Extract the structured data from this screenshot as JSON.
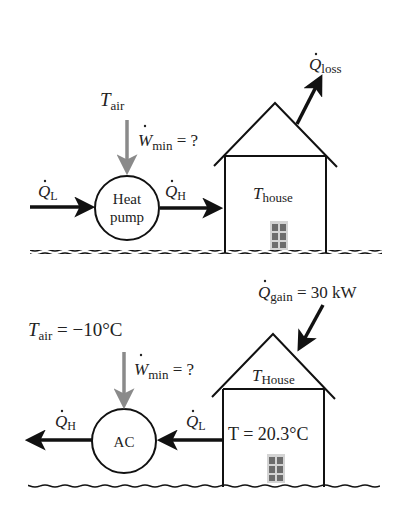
{
  "colors": {
    "line": "#111111",
    "work_arrow": "#8a8a8a",
    "text": "#222222",
    "door": "#777777"
  },
  "top_diagram": {
    "device_label_line1": "Heat",
    "device_label_line2": "pump",
    "t_air": {
      "main": "T",
      "sub": "air"
    },
    "w_min": {
      "main": "W",
      "sub": "min",
      "suffix": " = ?"
    },
    "q_l": {
      "main": "Q",
      "sub": "L"
    },
    "q_h": {
      "main": "Q",
      "sub": "H"
    },
    "q_loss": {
      "main": "Q",
      "sub": "loss"
    },
    "t_house": {
      "main": "T",
      "sub": "house"
    }
  },
  "bottom_diagram": {
    "device_label": "AC",
    "t_air": {
      "main": "T",
      "sub": "air",
      "suffix": " = −10°C"
    },
    "w_min": {
      "main": "W",
      "sub": "min",
      "suffix": " = ?"
    },
    "q_l": {
      "main": "Q",
      "sub": "L"
    },
    "q_h": {
      "main": "Q",
      "sub": "H"
    },
    "q_gain": {
      "main": "Q",
      "sub": "gain",
      "suffix": " = 30 kW"
    },
    "t_house": {
      "main": "T",
      "sub": "House"
    },
    "t_value": "T = 20.3°C"
  }
}
